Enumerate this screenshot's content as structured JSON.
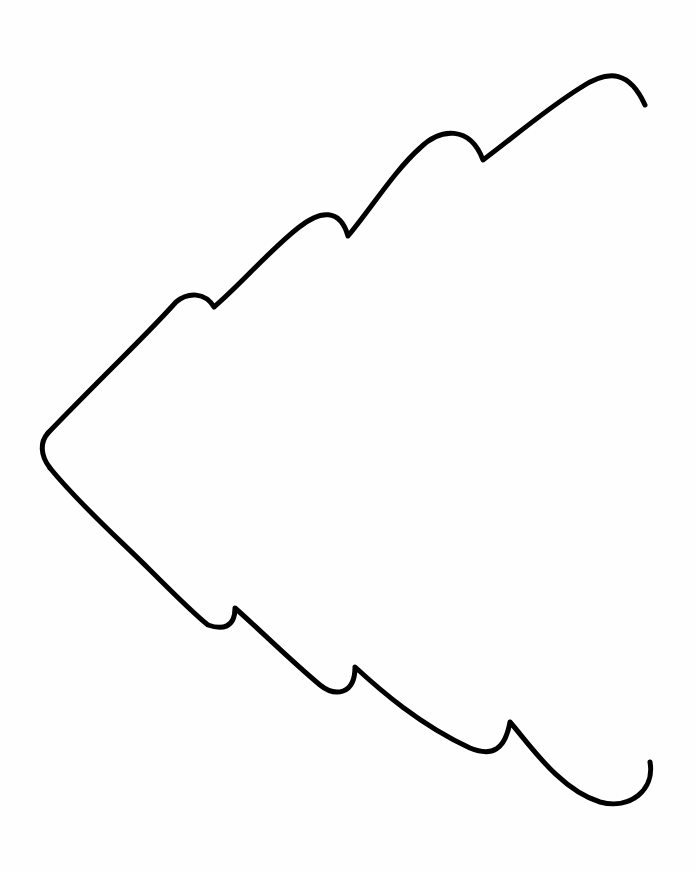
{
  "image": {
    "width": 695,
    "height": 872,
    "background": "#fefefe",
    "stroke_color": "#000000",
    "stroke_width": 5,
    "description": "Hand-drawn outline of a wavy sideways arrow / tree shape with scalloped edges"
  }
}
